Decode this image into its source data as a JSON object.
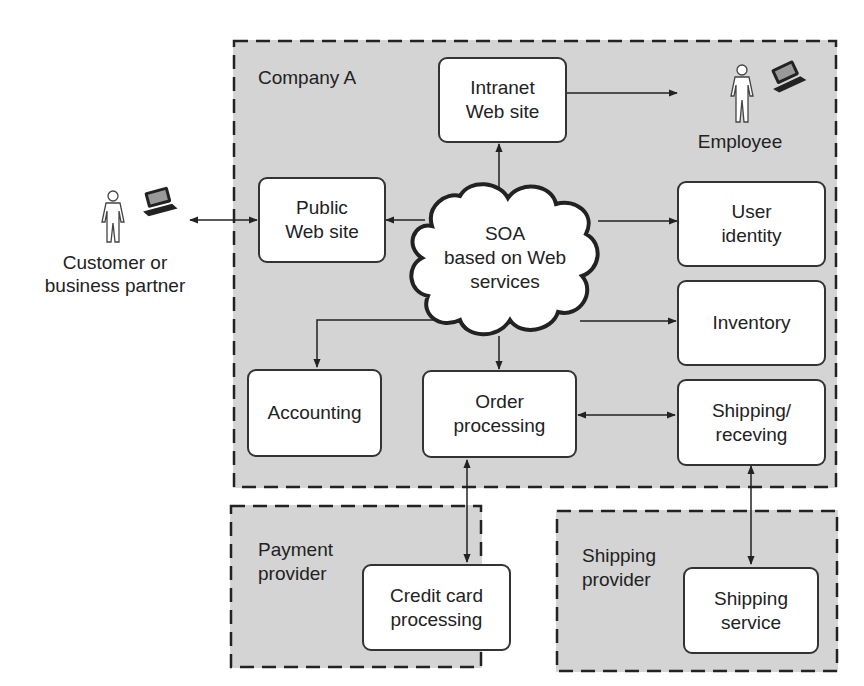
{
  "regions": {
    "company_a": {
      "label": "Company A"
    },
    "payment_provider": {
      "label": "Payment\nprovider"
    },
    "shipping_provider": {
      "label": "Shipping\nprovider"
    }
  },
  "actors": {
    "customer": {
      "label": "Customer or\nbusiness partner",
      "icons": [
        "person-icon",
        "laptop-icon"
      ]
    },
    "employee": {
      "label": "Employee",
      "icons": [
        "person-icon",
        "laptop-icon"
      ]
    }
  },
  "hub": {
    "label": "SOA\nbased on Web\nservices"
  },
  "nodes": {
    "intranet": {
      "label": "Intranet\nWeb site"
    },
    "public_web": {
      "label": "Public\nWeb site"
    },
    "user_identity": {
      "label": "User\nidentity"
    },
    "inventory": {
      "label": "Inventory"
    },
    "accounting": {
      "label": "Accounting"
    },
    "order_processing": {
      "label": "Order\nprocessing"
    },
    "shipping_receiving": {
      "label": "Shipping/\nreceving"
    },
    "credit_card": {
      "label": "Credit card\nprocessing"
    },
    "shipping_service": {
      "label": "Shipping\nservice"
    }
  },
  "edges": [
    {
      "from": "intranet",
      "to": "employee",
      "direction": "both"
    },
    {
      "from": "hub",
      "to": "intranet",
      "direction": "forward"
    },
    {
      "from": "customer",
      "to": "public_web",
      "direction": "both"
    },
    {
      "from": "hub",
      "to": "public_web",
      "direction": "forward"
    },
    {
      "from": "hub",
      "to": "user_identity",
      "direction": "forward"
    },
    {
      "from": "hub",
      "to": "inventory",
      "direction": "forward"
    },
    {
      "from": "hub",
      "to": "accounting",
      "direction": "forward"
    },
    {
      "from": "hub",
      "to": "order_processing",
      "direction": "forward"
    },
    {
      "from": "order_processing",
      "to": "shipping_receiving",
      "direction": "both"
    },
    {
      "from": "order_processing",
      "to": "credit_card",
      "direction": "both"
    },
    {
      "from": "shipping_receiving",
      "to": "shipping_service",
      "direction": "both"
    }
  ]
}
